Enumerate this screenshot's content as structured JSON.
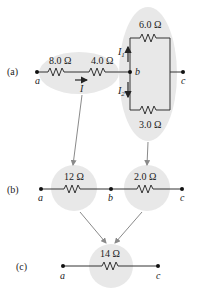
{
  "colors": {
    "wire": "#333333",
    "highlight": "#e6e6e6",
    "arrow": "#8a8a8a"
  },
  "panel_a": {
    "label": "(a)",
    "node_a": "a",
    "node_b": "b",
    "node_c": "c",
    "r1": "8.0 Ω",
    "r2": "4.0 Ω",
    "r_top": "6.0 Ω",
    "r_bottom": "3.0 Ω",
    "current_main": "I",
    "current_1": "I",
    "current_1_sub": "1",
    "current_2": "I",
    "current_2_sub": "2"
  },
  "panel_b": {
    "label": "(b)",
    "node_a": "a",
    "node_b": "b",
    "node_c": "c",
    "r1": "12 Ω",
    "r2": "2.0 Ω"
  },
  "panel_c": {
    "label": "(c)",
    "node_a": "a",
    "node_c": "c",
    "r1": "14 Ω"
  }
}
